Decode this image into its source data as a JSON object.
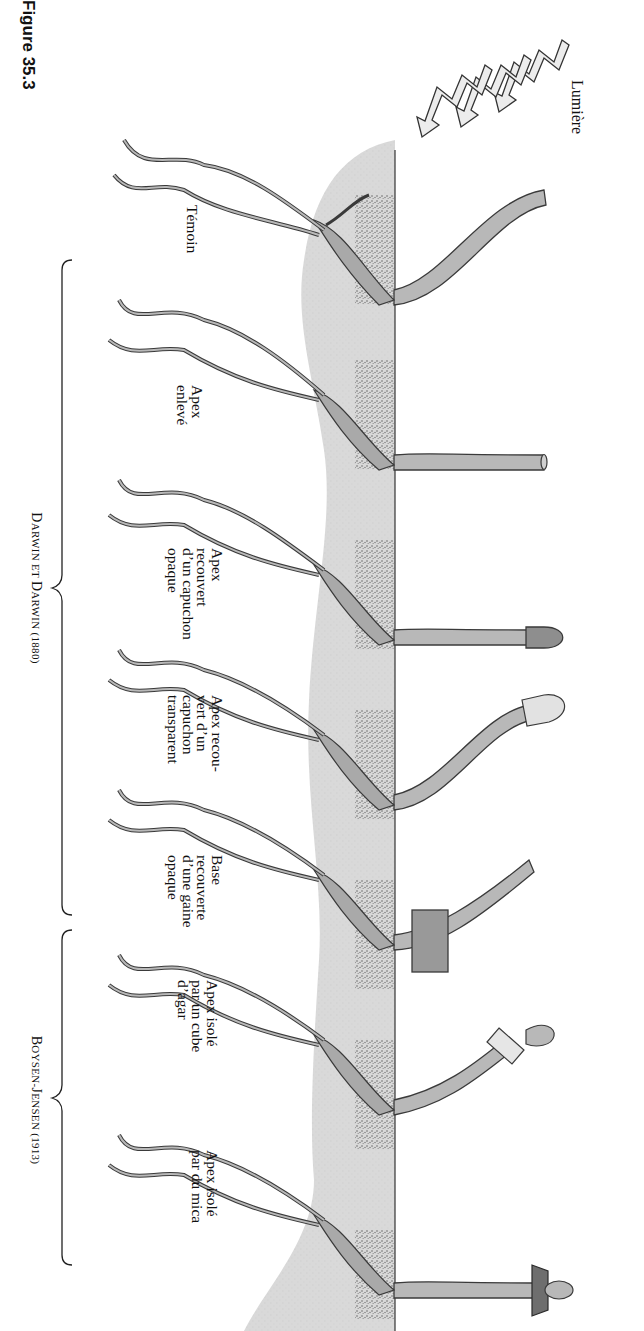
{
  "figure": {
    "title": "Figure 35.3",
    "light_label": "Lumière"
  },
  "seedlings": [
    {
      "label": "Témoin",
      "treatment": "control",
      "bent": true
    },
    {
      "label": "Apex\nenlevé",
      "treatment": "tip-removed",
      "bent": false
    },
    {
      "label": "Apex\nrecouvert\nd’un capuchon\nopaque",
      "treatment": "opaque-cap",
      "bent": false
    },
    {
      "label": "Apex recou-\nvert d’un\ncapuchon\ntransparent",
      "treatment": "transparent-cap",
      "bent": true
    },
    {
      "label": "Base\nrecouverte\nd’une gaine\nopaque",
      "treatment": "opaque-shield-base",
      "bent": true
    },
    {
      "label": "Apex isolé\npar un cube\nd’agar",
      "treatment": "gelatin-block",
      "bent": true
    },
    {
      "label": "Apex isolé\npar du mica",
      "treatment": "mica-barrier",
      "bent": false
    }
  ],
  "groups": [
    {
      "name_initial1": "D",
      "name_rest1": "ARWIN ET ",
      "name_initial2": "D",
      "name_rest2": "ARWIN",
      "year": " (1880)"
    },
    {
      "name_initial1": "B",
      "name_rest1": "OYSEN-",
      "name_initial2": "J",
      "name_rest2": "ENSEN",
      "year": " (1913)"
    }
  ],
  "colors": {
    "soil": "#d9d9d9",
    "seedling_fill": "#b8b8b8",
    "seedling_stroke": "#3a3a3a",
    "opaque_cap": "#8e8e8e",
    "transparent_cap": "#e2e2e2",
    "mica": "#6e6e6e",
    "arrow_fill": "#ececec"
  }
}
